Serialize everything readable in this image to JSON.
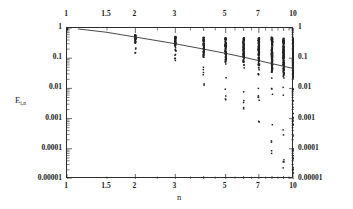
{
  "chart_data": {
    "type": "scatter",
    "title": "",
    "subtitle": "",
    "xlabel": "n",
    "ylabel": "E i,n",
    "ylabel_base": "E",
    "ylabel_sub": "i,n",
    "xscale": "log",
    "yscale": "log",
    "xlim": [
      1,
      10
    ],
    "ylim": [
      1e-05,
      1
    ],
    "grid": false,
    "legend": null,
    "legend_position": "none",
    "axes": {
      "x_ticks_top": [
        "1",
        "1.5",
        "2",
        "3",
        "5",
        "7",
        "10"
      ],
      "x_ticks_bottom": [
        "1",
        "1.5",
        "2",
        "3",
        "5",
        "7",
        "10"
      ],
      "x_tick_values": [
        1,
        1.5,
        2,
        3,
        5,
        7,
        10
      ],
      "y_ticks_left": [
        "1",
        "0.1",
        "0.01",
        "0.001",
        "0.0001",
        "0.00001"
      ],
      "y_ticks_right": [
        "1",
        "0.1",
        "0.01",
        "0.001",
        "0.0001",
        "0.00001"
      ],
      "y_tick_values": [
        1,
        0.1,
        0.01,
        0.001,
        0.0001,
        1e-05
      ],
      "mirrored_axes": true
    },
    "series": [
      {
        "name": "fit-curve",
        "type": "line",
        "color": "#333333",
        "x": [
          1.12,
          1.5,
          2,
          2.5,
          3,
          4,
          5,
          6,
          7,
          8,
          9,
          10
        ],
        "y": [
          0.93,
          0.72,
          0.5,
          0.38,
          0.3,
          0.2,
          0.145,
          0.108,
          0.083,
          0.066,
          0.054,
          0.045
        ]
      },
      {
        "name": "scatter-points",
        "type": "scatter",
        "color": "#222222",
        "marker": "dot",
        "columns": [
          {
            "n": 1,
            "ymin": 0.92,
            "ymax": 1.0,
            "count": 6,
            "dense_to": 1.0
          },
          {
            "n": 2,
            "ymin": 0.15,
            "ymax": 0.62,
            "count": 42,
            "dense_to": 0.3
          },
          {
            "n": 3,
            "ymin": 0.062,
            "ymax": 0.55,
            "count": 58,
            "dense_to": 0.17
          },
          {
            "n": 4,
            "ymin": 0.012,
            "ymax": 0.52,
            "count": 70,
            "dense_to": 0.1
          },
          {
            "n": 5,
            "ymin": 0.0038,
            "ymax": 0.5,
            "count": 86,
            "dense_to": 0.065
          },
          {
            "n": 6,
            "ymin": 0.0011,
            "ymax": 0.5,
            "count": 104,
            "dense_to": 0.045
          },
          {
            "n": 7,
            "ymin": 0.00042,
            "ymax": 0.5,
            "count": 122,
            "dense_to": 0.033
          },
          {
            "n": 8,
            "ymin": 5e-05,
            "ymax": 0.52,
            "count": 140,
            "dense_to": 0.025
          },
          {
            "n": 9,
            "ymin": 2e-05,
            "ymax": 0.48,
            "count": 150,
            "dense_to": 0.02
          },
          {
            "n": 10,
            "ymin": 7e-06,
            "ymax": 0.5,
            "count": 168,
            "dense_to": 0.016
          }
        ]
      }
    ]
  }
}
